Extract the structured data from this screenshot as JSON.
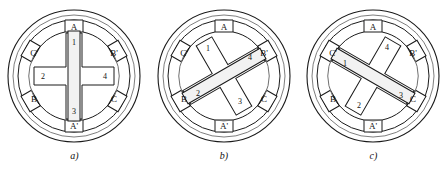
{
  "diagram": {
    "figure_count": 3,
    "colors": {
      "stroke": "#1a1a1a",
      "stroke_light": "#7a7a7a",
      "fill": "#ffffff",
      "background": "#ffffff"
    },
    "stator": {
      "pole_count": 6,
      "pole_labels": [
        "A",
        "B'",
        "C",
        "A'",
        "B",
        "C'"
      ],
      "pole_angles_deg": [
        90,
        30,
        -30,
        -90,
        -150,
        150
      ]
    },
    "rotor": {
      "pole_count": 4,
      "pole_labels": [
        "1",
        "2",
        "3",
        "4"
      ]
    },
    "figures": [
      {
        "caption": "a)",
        "rotor_rotation_deg": 0,
        "bar_angle_deg": 90,
        "energized_phase": "A",
        "rotor_labels": {
          "top": "1",
          "left": "2",
          "bottom": "3",
          "right": "4"
        },
        "stator_labels": {
          "top": "A",
          "upper_right": "B'",
          "lower_right": "C",
          "bottom": "A'",
          "lower_left": "B",
          "upper_left": "C'"
        }
      },
      {
        "caption": "b)",
        "rotor_rotation_deg": 30,
        "bar_angle_deg": 30,
        "energized_phase": "B",
        "rotor_labels": {
          "top": "1",
          "left": "2",
          "bottom": "3",
          "right": "4"
        },
        "stator_labels": {
          "top": "A",
          "upper_right": "B'",
          "lower_right": "C",
          "bottom": "A'",
          "lower_left": "B",
          "upper_left": "C'"
        }
      },
      {
        "caption": "c)",
        "rotor_rotation_deg": 60,
        "bar_angle_deg": -30,
        "energized_phase": "C",
        "rotor_labels": {
          "top": "4",
          "left": "1",
          "bottom": "2",
          "right": "3"
        },
        "stator_labels": {
          "top": "A",
          "upper_right": "B'",
          "lower_right": "C",
          "bottom": "A'",
          "lower_left": "B",
          "upper_left": "C'"
        }
      }
    ]
  }
}
